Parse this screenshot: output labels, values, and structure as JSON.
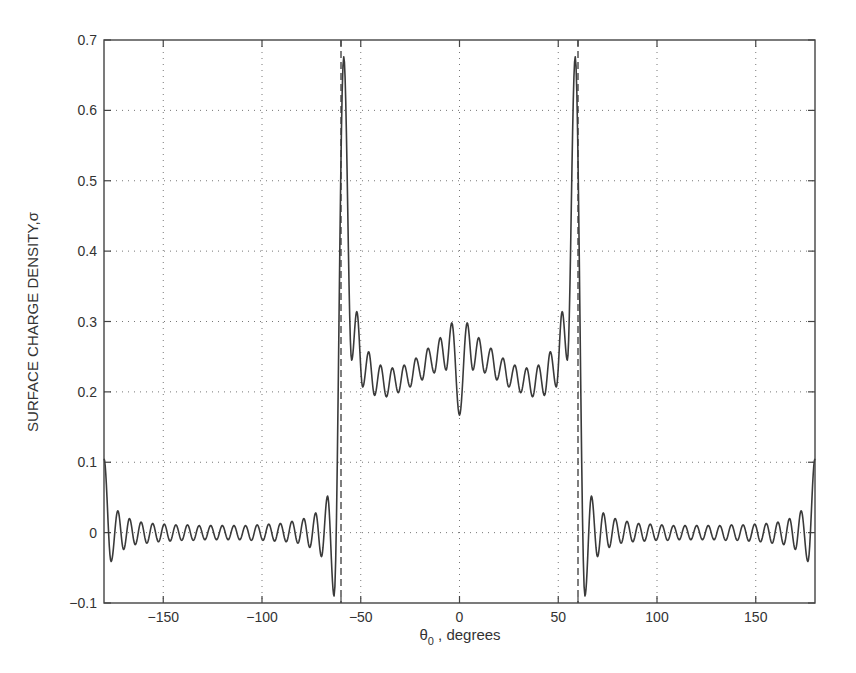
{
  "chart_data": {
    "type": "line",
    "title": "",
    "xlabel": "θ",
    "xlabel_sub": "0",
    "xlabel_suffix": " , degrees",
    "ylabel": "SURFACE  CHARGE  DENSITY,σ",
    "xlim": [
      -180,
      180
    ],
    "ylim": [
      -0.1,
      0.7
    ],
    "xticks": [
      -150,
      -100,
      -50,
      0,
      50,
      100,
      150
    ],
    "xtick_labels": [
      "−150",
      "−100",
      "−50",
      "0",
      "50",
      "100",
      "150"
    ],
    "yticks": [
      -0.1,
      0,
      0.1,
      0.2,
      0.3,
      0.4,
      0.5,
      0.6,
      0.7
    ],
    "ytick_labels": [
      "−0.1",
      "0",
      "0.1",
      "0.2",
      "0.3",
      "0.4",
      "0.5",
      "0.6",
      "0.7"
    ],
    "grid": true,
    "grid_style": "dotted",
    "legend": null,
    "symmetric_about_zero": true,
    "vertical_markers": [
      {
        "x": -60,
        "style": "dashed"
      },
      {
        "x": 60,
        "style": "dashed"
      }
    ],
    "series": [
      {
        "name": "surface charge density",
        "note": "extrema for theta >= 0; curve is mirrored for theta < 0",
        "extrema_positive_side": [
          [
            0,
            0.167
          ],
          [
            3.9,
            0.298
          ],
          [
            6.8,
            0.231
          ],
          [
            9.7,
            0.277
          ],
          [
            12.8,
            0.227
          ],
          [
            15.9,
            0.262
          ],
          [
            18.9,
            0.217
          ],
          [
            22.0,
            0.248
          ],
          [
            25.0,
            0.207
          ],
          [
            28.0,
            0.238
          ],
          [
            31.0,
            0.199
          ],
          [
            34.0,
            0.234
          ],
          [
            37.0,
            0.193
          ],
          [
            40.0,
            0.238
          ],
          [
            43.0,
            0.195
          ],
          [
            46.0,
            0.257
          ],
          [
            49.0,
            0.207
          ],
          [
            52.0,
            0.314
          ],
          [
            54.6,
            0.245
          ],
          [
            58.6,
            0.676
          ],
          [
            63.5,
            -0.09
          ],
          [
            66.8,
            0.052
          ],
          [
            69.9,
            -0.034
          ],
          [
            72.8,
            0.028
          ],
          [
            75.8,
            -0.021
          ],
          [
            78.8,
            0.02
          ],
          [
            81.8,
            -0.015
          ],
          [
            84.8,
            0.016
          ],
          [
            87.74,
            -0.013
          ],
          [
            90.68,
            0.013
          ],
          [
            93.62,
            -0.012
          ],
          [
            96.56,
            0.012
          ],
          [
            99.5,
            -0.011
          ],
          [
            102.44,
            0.011
          ],
          [
            105.38,
            -0.011
          ],
          [
            108.32,
            0.01
          ],
          [
            111.26,
            -0.01
          ],
          [
            114.2,
            0.01
          ],
          [
            117.14,
            -0.01
          ],
          [
            120.08,
            0.01
          ],
          [
            123.02,
            -0.01
          ],
          [
            125.96,
            0.01
          ],
          [
            128.9,
            -0.01
          ],
          [
            131.84,
            0.01
          ],
          [
            134.78,
            -0.011
          ],
          [
            137.72,
            0.011
          ],
          [
            140.66,
            -0.011
          ],
          [
            143.6,
            0.011
          ],
          [
            146.54,
            -0.012
          ],
          [
            149.48,
            0.012
          ],
          [
            152.42,
            -0.013
          ],
          [
            155.36,
            0.013
          ],
          [
            158.3,
            -0.015
          ],
          [
            161.24,
            0.015
          ],
          [
            164.18,
            -0.017
          ],
          [
            167.12,
            0.02
          ],
          [
            170.06,
            -0.024
          ],
          [
            173.0,
            0.031
          ],
          [
            176.4,
            -0.041
          ],
          [
            180.0,
            0.105
          ]
        ]
      }
    ]
  },
  "layout": {
    "plot_left": 104,
    "plot_right": 815,
    "plot_top": 40,
    "plot_bottom": 603,
    "marker_tick_len": 6,
    "tick_len": 7
  }
}
